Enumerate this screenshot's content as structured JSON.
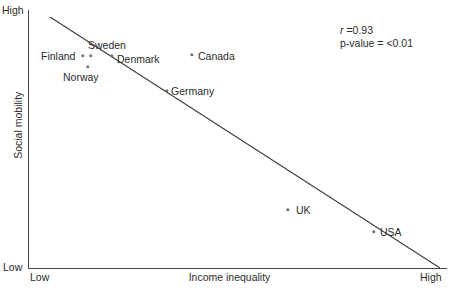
{
  "chart_data": {
    "type": "scatter",
    "title": "",
    "xlabel": "Income inequality",
    "ylabel": "Social mobility",
    "x_tick_labels": [
      "Low",
      "High"
    ],
    "y_tick_labels": [
      "Low",
      "High"
    ],
    "xlim": [
      "Low",
      "High"
    ],
    "ylim": [
      "Low",
      "High"
    ],
    "grid": false,
    "legend": false,
    "annotations": {
      "r_symbol": "r",
      "r_text": " =0.93",
      "r_value": 0.93,
      "p_value_text": "p-value = <0.01",
      "p_value": "<0.01"
    },
    "trendline": {
      "present": true,
      "direction": "negative",
      "x1": 50,
      "y1": 17,
      "x2": 440,
      "y2": 268
    },
    "point_color": "#6e6e6e",
    "axis_color": "#4a4a4a",
    "points": [
      {
        "label": "Finland",
        "x": 83,
        "y": 56,
        "label_x": 41,
        "label_y": 51,
        "x_value": 0.13,
        "y_value": 0.82
      },
      {
        "label": "Sweden",
        "x": 91,
        "y": 56,
        "label_x": 88,
        "label_y": 40,
        "x_value": 0.15,
        "y_value": 0.82
      },
      {
        "label": "Denmark",
        "x": 112,
        "y": 56,
        "label_x": 117,
        "label_y": 54,
        "x_value": 0.2,
        "y_value": 0.82
      },
      {
        "label": "Norway",
        "x": 88,
        "y": 67,
        "label_x": 63,
        "label_y": 72,
        "x_value": 0.14,
        "y_value": 0.78
      },
      {
        "label": "Canada",
        "x": 192,
        "y": 55,
        "label_x": 198,
        "label_y": 51,
        "x_value": 0.39,
        "y_value": 0.83
      },
      {
        "label": "Germany",
        "x": 167,
        "y": 91,
        "label_x": 171,
        "label_y": 86,
        "x_value": 0.33,
        "y_value": 0.69
      },
      {
        "label": "UK",
        "x": 288,
        "y": 210,
        "label_x": 296,
        "label_y": 205,
        "x_value": 0.62,
        "y_value": 0.23
      },
      {
        "label": "USA",
        "x": 374,
        "y": 232,
        "label_x": 380,
        "label_y": 227,
        "x_value": 0.83,
        "y_value": 0.14
      }
    ]
  },
  "axes": {
    "y_high": "High",
    "y_low": "Low",
    "x_low": "Low",
    "x_high": "High",
    "x_title": "Income inequality",
    "y_title": "Social mobility"
  },
  "stats": {
    "r_symbol": "r",
    "r_text": " =0.93",
    "p_value_text": "p-value = <0.01"
  }
}
